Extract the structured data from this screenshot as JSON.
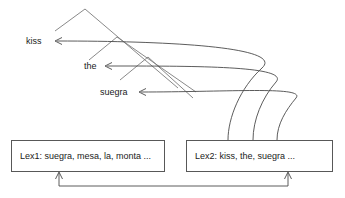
{
  "diagram": {
    "words": [
      {
        "id": "kiss",
        "label": "kiss",
        "x": 26,
        "y": 37,
        "arrow_tip_x": 55,
        "arrow_tip_y": 41
      },
      {
        "id": "the",
        "label": "the",
        "x": 84,
        "y": 62,
        "arrow_tip_x": 105,
        "arrow_tip_y": 66
      },
      {
        "id": "suegra",
        "label": "suegra",
        "x": 100,
        "y": 88,
        "arrow_tip_x": 139,
        "arrow_tip_y": 92
      }
    ],
    "boxes": [
      {
        "id": "lex1",
        "label": "Lex1: suegra, mesa, la, monta ...",
        "x": 11,
        "y": 140,
        "width": 154,
        "height": 32
      },
      {
        "id": "lex2",
        "label": "Lex2: kiss, the, suegra ...",
        "x": 186,
        "y": 140,
        "width": 147,
        "height": 32
      }
    ],
    "tree": {
      "description": "binary branching structure above the word labels",
      "segments": [
        {
          "name": "apex-left-leg",
          "x1": 85,
          "y1": 9,
          "x2": 55,
          "y2": 31
        },
        {
          "name": "apex-right-leg",
          "x1": 85,
          "y1": 9,
          "x2": 178,
          "y2": 88
        },
        {
          "name": "node2-left-leg",
          "x1": 117,
          "y1": 37,
          "x2": 89,
          "y2": 60
        },
        {
          "name": "node2-right-leg",
          "x1": 117,
          "y1": 37,
          "x2": 196,
          "y2": 92
        },
        {
          "name": "node3-left-leg",
          "x1": 148,
          "y1": 57,
          "x2": 120,
          "y2": 80
        },
        {
          "name": "node3-right-leg",
          "x1": 148,
          "y1": 57,
          "x2": 193,
          "y2": 98
        }
      ]
    },
    "links": [
      {
        "id": "link-kiss",
        "from_box": "lex2",
        "to_word": "kiss",
        "path": "M 228 140 C 228 118 240 88 262 68 C 284 48 180 41 57 41"
      },
      {
        "id": "link-the",
        "from_box": "lex2",
        "to_word": "the",
        "path": "M 253 140 C 253 120 262 98 276 82 C 290 66 200 66 107 66"
      },
      {
        "id": "link-suegra",
        "from_box": "lex2",
        "to_word": "suegra",
        "path": "M 277 140 C 277 124 286 110 296 98 C 306 86 230 92 141 92"
      }
    ],
    "feedback": {
      "description": "bottom connector joining both lexicon boxes with upward arrows",
      "baseline_y": 186,
      "left_arrow_x": 59,
      "right_arrow_x": 288,
      "box_bottom_y": 172
    },
    "colors": {
      "line": "#4a4a4a",
      "tree_line": "#7c7c7c",
      "box_border": "#585858",
      "text": "#1a1a1a",
      "background": "#ffffff"
    }
  }
}
